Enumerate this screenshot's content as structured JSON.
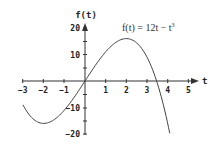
{
  "chart_data": {
    "type": "line",
    "title": "",
    "annotation": "f(t) = 12t − t³",
    "xlabel": "t",
    "ylabel": "f(t)",
    "xlim": [
      -3,
      5
    ],
    "ylim": [
      -20,
      20
    ],
    "xticks": [
      -3,
      -2,
      -1,
      1,
      2,
      3,
      4,
      5
    ],
    "yticks": [
      20,
      10,
      -10,
      -20
    ],
    "grid": false,
    "legend": null,
    "series": [
      {
        "name": "f(t) = 12t - t^3",
        "x": [
          -3,
          -2.5,
          -2,
          -1.5,
          -1,
          -0.5,
          0,
          0.5,
          1,
          1.5,
          2,
          2.5,
          3,
          3.5,
          4,
          4.1
        ],
        "y": [
          -9,
          -14.375,
          -16,
          -14.625,
          -11,
          -5.875,
          0,
          5.875,
          11,
          14.625,
          16,
          14.375,
          9,
          0.875,
          -16,
          -19.7
        ]
      }
    ]
  },
  "labels": {
    "x_axis": "t",
    "y_axis": "f(t)",
    "formula_prefix": "f(t) = 12t − t",
    "formula_exp": "3",
    "xtick_labels": [
      "−3",
      "−2",
      "−1",
      "1",
      "2",
      "3",
      "4",
      "5"
    ],
    "ytick_labels": [
      "20",
      "10",
      "−10",
      "−20"
    ]
  }
}
